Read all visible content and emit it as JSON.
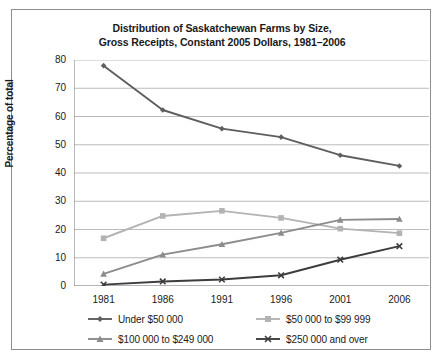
{
  "chart_data": {
    "type": "line",
    "title": "Distribution of Saskatchewan Farms by Size, Gross Receipts, Constant 2005 Dollars, 1981–2006",
    "title_line1": "Distribution of Saskatchewan Farms by Size,",
    "title_line2": "Gross Receipts, Constant 2005 Dollars, 1981–2006",
    "xlabel": "",
    "ylabel": "Percentage of total",
    "categories": [
      "1981",
      "1986",
      "1991",
      "1996",
      "2001",
      "2006"
    ],
    "x": [
      1981,
      1986,
      1991,
      1996,
      2001,
      2006
    ],
    "ylim": [
      0,
      80
    ],
    "yticks": [
      "0",
      "10",
      "20",
      "30",
      "40",
      "50",
      "60",
      "70",
      "80"
    ],
    "grid": true,
    "legend_position": "bottom",
    "series": [
      {
        "name": "Under $50 000",
        "values": [
          78,
          62.3,
          55.7,
          52.7,
          46.3,
          42.5
        ],
        "color": "#5e5e5e",
        "marker": "diamond"
      },
      {
        "name": "$50 000 to $99 999",
        "values": [
          16.9,
          24.8,
          26.6,
          24.1,
          20.3,
          18.7
        ],
        "color": "#b3b3b3",
        "marker": "square"
      },
      {
        "name": "$100 000 to $249 000",
        "values": [
          4.3,
          11.1,
          14.8,
          18.8,
          23.4,
          23.7
        ],
        "color": "#8c8c8c",
        "marker": "triangle"
      },
      {
        "name": "$250 000 and over",
        "values": [
          0.5,
          1.6,
          2.3,
          3.8,
          9.3,
          14.1
        ],
        "color": "#3d3d3d",
        "marker": "cross"
      }
    ]
  }
}
